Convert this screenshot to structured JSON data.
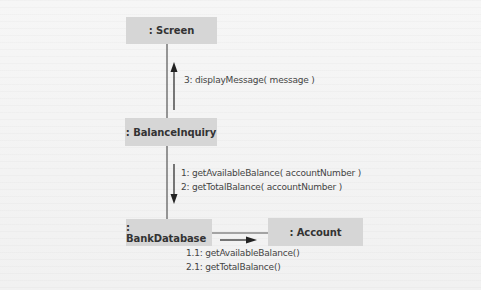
{
  "diagram": {
    "type": "UML communication diagram",
    "objects": [
      {
        "id": "screen",
        "label": ": Screen"
      },
      {
        "id": "balance_inquiry",
        "label": ": BalanceInquiry"
      },
      {
        "id": "bank_database",
        "label": ": BankDatabase"
      },
      {
        "id": "account",
        "label": ": Account"
      }
    ],
    "messages": {
      "bi_to_screen": [
        "3: displayMessage( message )"
      ],
      "bi_to_db": [
        "1: getAvailableBalance( accountNumber )",
        "2: getTotalBalance( accountNumber )"
      ],
      "db_to_account": [
        "1.1: getAvailableBalance()",
        "2.1: getTotalBalance()"
      ]
    },
    "colors": {
      "object_fill": "#d6d6d6",
      "line": "#555555",
      "arrow": "#222222",
      "text": "#333333"
    }
  }
}
